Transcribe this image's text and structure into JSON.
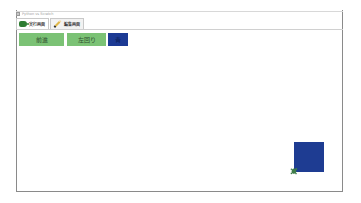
{
  "window": {
    "title": "Python vs Scratch"
  },
  "tabs": [
    {
      "label": "実行画面",
      "icon": "turtle-icon",
      "active": true
    },
    {
      "label": "編集画面",
      "icon": "pencil-icon",
      "active": false
    }
  ],
  "buttons": [
    {
      "label": "前進",
      "color": "#7bc275"
    },
    {
      "label": "左回り",
      "color": "#7bc275"
    },
    {
      "label": "青",
      "color": "#1c3a94"
    }
  ],
  "stage": {
    "drawn_square_color": "#1e3c92",
    "sprite": "turtle-sprite"
  }
}
